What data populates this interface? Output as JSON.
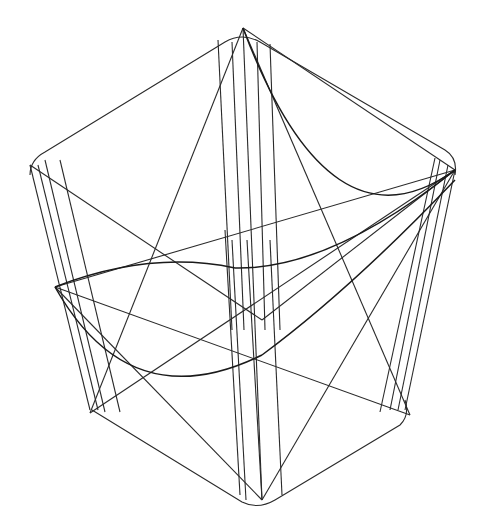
{
  "canvas": {
    "width": 495,
    "height": 528,
    "background": "#ffffff",
    "stroke": "#2a2a2a"
  },
  "figure": {
    "top_outline": "M30,175 Q30,160 45,152 L225,42 Q242,32 260,42 L445,150 Q458,158 455,175",
    "bottom_outline": "M92,410 L242,502 Q258,510 275,500 L400,425 Q410,415 405,400",
    "lines": [
      [
        243,
        28,
        90,
        413
      ],
      [
        243,
        28,
        262,
        500
      ],
      [
        243,
        28,
        410,
        415
      ],
      [
        243,
        28,
        455,
        170
      ],
      [
        90,
        413,
        455,
        170
      ],
      [
        55,
        287,
        410,
        415
      ],
      [
        55,
        287,
        262,
        500
      ],
      [
        55,
        287,
        455,
        170
      ],
      [
        262,
        500,
        455,
        170
      ],
      [
        30,
        165,
        262,
        320
      ],
      [
        262,
        320,
        455,
        170
      ],
      [
        30,
        165,
        90,
        410
      ],
      [
        38,
        165,
        98,
        410
      ],
      [
        45,
        160,
        105,
        412
      ],
      [
        60,
        160,
        120,
        412
      ],
      [
        455,
        170,
        405,
        410
      ],
      [
        448,
        165,
        398,
        410
      ],
      [
        440,
        160,
        390,
        410
      ],
      [
        435,
        158,
        380,
        412
      ],
      [
        218,
        40,
        232,
        330
      ],
      [
        232,
        42,
        244,
        330
      ],
      [
        257,
        42,
        265,
        330
      ],
      [
        270,
        44,
        280,
        330
      ],
      [
        225,
        230,
        240,
        495
      ],
      [
        232,
        240,
        246,
        500
      ],
      [
        247,
        240,
        262,
        500
      ],
      [
        270,
        240,
        282,
        495
      ]
    ],
    "curves": [
      "M55,287 Q150,250 235,268",
      "M235,268 Q330,270 455,170",
      "M55,287 Q130,420 262,355",
      "M262,355 Q350,290 455,180",
      "M243,28 Q330,260 455,170"
    ]
  }
}
